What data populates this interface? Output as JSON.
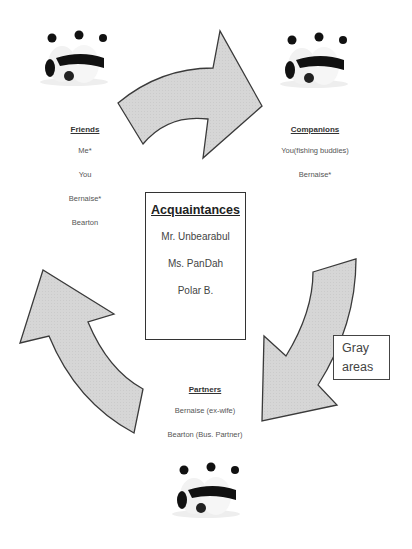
{
  "diagram": {
    "groups": {
      "friends": {
        "title": "Friends",
        "items": [
          "Me*",
          "You",
          "Bernaise*",
          "Bearton"
        ]
      },
      "companions": {
        "title": "Companions",
        "items": [
          "You(fishing buddies)",
          "Bernaise*"
        ]
      },
      "partners": {
        "title": "Partners",
        "items": [
          "Bernaise (ex-wife)",
          "Bearton (Bus. Partner)"
        ]
      }
    },
    "center": {
      "title": "Acquaintances",
      "items": [
        "Mr. Unbearabul",
        "Ms. PanDah",
        "Polar B."
      ]
    },
    "callout": {
      "line1": "Gray",
      "line2": "areas"
    },
    "images": [
      "panda-hug-image",
      "panda-hug-image",
      "panda-hug-image"
    ],
    "colors": {
      "arrow_fill": "#d4d4d4",
      "arrow_stroke": "#3a3a3a",
      "text": "#555555"
    }
  }
}
